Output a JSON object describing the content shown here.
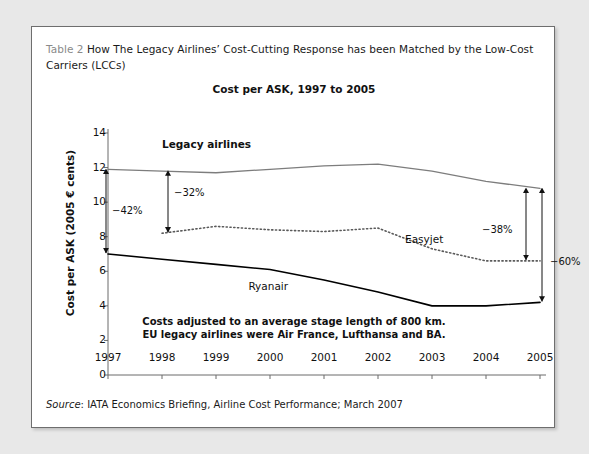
{
  "caption": {
    "label": "Table 2",
    "text": "How The Legacy Airlines’ Cost-Cutting Response has been Matched by the Low-Cost Carriers (LCCs)"
  },
  "source": {
    "prefix": "Source",
    "text": ": IATA Economics Briefing, Airline Cost Performance; March 2007"
  },
  "footnote": {
    "line1": "Costs adjusted to an average stage length of 800 km.",
    "line2": "EU legacy airlines were Air France, Lufthansa and BA."
  },
  "colors": {
    "legacy": "#7d7d7d",
    "easyjet": "#5a5a5a",
    "ryanair": "#000000",
    "axis": "#6b6b6b",
    "caption_label": "#8a8a8a"
  },
  "chart_data": {
    "type": "line",
    "title": "Cost per ASK, 1997 to 2005",
    "xlabel": "",
    "ylabel": "Cost per ASK (2005 € cents)",
    "xlim": [
      1997,
      2005
    ],
    "ylim": [
      0,
      14
    ],
    "yticks": [
      14,
      12,
      10,
      8,
      6,
      4,
      2,
      0
    ],
    "grid": false,
    "legend": "inline-labels",
    "categories": [
      1997,
      1998,
      1999,
      2000,
      2001,
      2002,
      2003,
      2004,
      2005
    ],
    "series": [
      {
        "name": "Legacy airlines",
        "style": "solid",
        "color": "#7d7d7d",
        "values": [
          11.9,
          11.8,
          11.7,
          11.9,
          12.1,
          12.2,
          11.8,
          11.2,
          10.8
        ]
      },
      {
        "name": "Easyjet",
        "style": "dotted",
        "color": "#5a5a5a",
        "values": [
          null,
          8.2,
          8.6,
          8.4,
          8.3,
          8.5,
          7.3,
          6.6,
          6.6
        ]
      },
      {
        "name": "Ryanair",
        "style": "solid",
        "color": "#000000",
        "values": [
          7.0,
          6.7,
          6.4,
          6.1,
          5.5,
          4.8,
          4.0,
          4.0,
          4.2
        ]
      }
    ],
    "annotations": [
      {
        "id": "drop-1997-legacy-ryanair",
        "label": "−42%",
        "year": 1997,
        "from": 11.9,
        "to": 7.0
      },
      {
        "id": "drop-1998-legacy-easyjet",
        "label": "−32%",
        "year": 1998,
        "from": 11.8,
        "to": 8.2
      },
      {
        "id": "drop-2005-legacy-easyjet",
        "label": "−38%",
        "year": 2005,
        "from": 10.8,
        "to": 6.6
      },
      {
        "id": "drop-2005-legacy-ryanair",
        "label": "−60%",
        "year": 2005,
        "from": 10.8,
        "to": 4.2
      }
    ],
    "series_labels": [
      {
        "name": "Legacy airlines",
        "x": 1998.0,
        "y": 13.3
      },
      {
        "name": "Easyjet",
        "x": 2002.5,
        "y": 7.8
      },
      {
        "name": "Ryanair",
        "x": 1999.6,
        "y": 5.1
      }
    ]
  }
}
